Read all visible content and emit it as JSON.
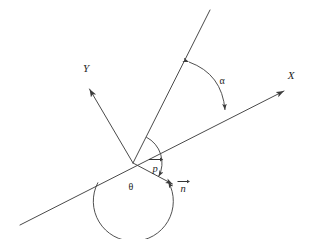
{
  "figure": {
    "type": "geometry-diagram",
    "title": "",
    "background_color": "#ffffff",
    "line_color": "#4a4a4a",
    "label_color": "#1d1d1d",
    "width": 310,
    "height": 239
  },
  "labels": {
    "x_axis": "X",
    "y_axis": "Y",
    "alpha": "α",
    "theta": "θ",
    "vector_p": "p",
    "vector_n": "n"
  },
  "geometry": {
    "origin": {
      "x": 133,
      "y": 163
    },
    "x_axis": {
      "name": "X",
      "from": {
        "x": 20,
        "y": 225
      },
      "to": {
        "x": 287,
        "y": 90
      },
      "arrow_at": "to",
      "label_at": {
        "x": 291,
        "y": 79
      }
    },
    "y_axis": {
      "name": "Y",
      "from": {
        "x": 133,
        "y": 163
      },
      "to": {
        "x": 87,
        "y": 86
      },
      "arrow_at": "to",
      "label_at": {
        "x": 86,
        "y": 72
      }
    },
    "slant_ray": {
      "name": "incident-ray",
      "from": {
        "x": 133,
        "y": 163
      },
      "to": {
        "x": 210,
        "y": 10
      },
      "arrow_at": "none"
    },
    "vector_n": {
      "name": "n",
      "from": {
        "x": 133,
        "y": 163
      },
      "to": {
        "x": 176,
        "y": 186
      },
      "arrow_at": "to",
      "label_at": {
        "x": 183,
        "y": 190
      }
    },
    "alpha_arc": {
      "label": "α",
      "label_at": {
        "x": 222,
        "y": 83
      },
      "start": {
        "x": 184,
        "y": 68
      },
      "end": {
        "x": 226,
        "y": 114
      },
      "arrows": "both"
    },
    "p_arc": {
      "label": "p",
      "label_at": {
        "x": 155,
        "y": 168
      },
      "radius": 29,
      "start_angle_deg": -63,
      "end_angle_deg": 28,
      "arrows": "start"
    },
    "theta_arc": {
      "label": "θ",
      "label_at": {
        "x": 131,
        "y": 189
      },
      "radius": 40,
      "start_angle_deg": 151,
      "end_angle_deg": 28,
      "arrows": "end"
    }
  }
}
